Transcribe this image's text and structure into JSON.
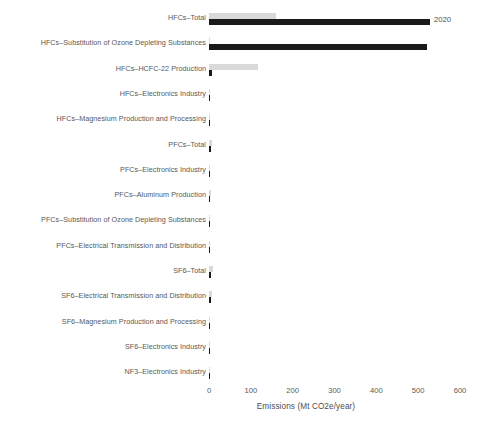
{
  "chart_data": {
    "type": "bar",
    "orientation": "horizontal",
    "title": "",
    "subtitle": "",
    "xlabel": "Emissions (Mt CO2e/year)",
    "ylabel": "",
    "xlim": [
      0,
      600
    ],
    "xticks": [
      0,
      100,
      200,
      300,
      400,
      500,
      600
    ],
    "xtick_labels": [
      "0",
      "100",
      "200",
      "300",
      "400",
      "500",
      "600"
    ],
    "grid": false,
    "legend_position": "inline-annotation-right-of-top-bar",
    "annotations": [
      {
        "text": "2020",
        "series": "2020",
        "category": "HFCs-Total"
      }
    ],
    "categories": [
      "HFCs–Total",
      "HFCs–Substitution of Ozone Depleting Substances",
      "HFCs–HCFC-22 Production",
      "HFCs–Electronics Industry",
      "HFCs–Magnesium Production and Processing",
      "PFCs–Total",
      "PFCs–Electronics Industry",
      "PFCs–Aluminum Production",
      "PFCs–Substitution of Ozone Depleting Substances",
      "PFCs–Electrical Transmission and Distribution",
      "SF6–Total",
      "SF6–Electrical Transmission and Distribution",
      "SF6–Magnesium Production and Processing",
      "SF6–Electronics Industry",
      "NF3–Electronics Industry"
    ],
    "series": [
      {
        "name": "earlier",
        "color": "#d9d9d9",
        "values": [
          160,
          2,
          117,
          0.5,
          0.2,
          6,
          1.5,
          4,
          0.3,
          0.2,
          10,
          8,
          0.6,
          1.5,
          0.6
        ]
      },
      {
        "name": "2020",
        "color": "#1a1a1a",
        "values": [
          529,
          521,
          7,
          1.5,
          0.2,
          5,
          3,
          2,
          0.3,
          0.2,
          5,
          4,
          0.3,
          0.8,
          0.6
        ]
      }
    ]
  },
  "axis": {
    "x_title": "Emissions (Mt CO2e/year)",
    "ticks": [
      "0",
      "100",
      "200",
      "300",
      "400",
      "500",
      "600"
    ]
  },
  "annotation": {
    "year_label": "2020"
  },
  "labels": {
    "r0": "HFCs–Total",
    "r1": "HFCs–Substitution of Ozone Depleting Substances",
    "r2": "HFCs–HCFC-22 Production",
    "r3": "HFCs–Electronics Industry",
    "r4": "HFCs–Magnesium Production and Processing",
    "r5": "PFCs–Total",
    "r6": "PFCs–Electronics Industry",
    "r7": "PFCs–Aluminum Production",
    "r8": "PFCs–Substitution of Ozone Depleting Substances",
    "r9": "PFCs–Electrical Transmission and Distribution",
    "r10": "SF6–Total",
    "r11": "SF6–Electrical Transmission and Distribution",
    "r12": "SF6–Magnesium Production and Processing",
    "r13": "SF6–Electronics Industry",
    "r14": "NF3–Electronics Industry"
  }
}
